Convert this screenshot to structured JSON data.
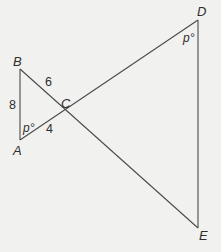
{
  "diagram": {
    "type": "two triangles sharing vertex C (bowtie / vertical angles)",
    "colors": {
      "background": "#f1f1ef",
      "stroke": "#4a4a4a",
      "text": "#2e2e2e"
    },
    "points": {
      "A": {
        "label": "A",
        "x": 20,
        "y": 140
      },
      "B": {
        "label": "B",
        "x": 20,
        "y": 69
      },
      "C": {
        "label": "C",
        "x": 65,
        "y": 111
      },
      "D": {
        "label": "D",
        "x": 198,
        "y": 20
      },
      "E": {
        "label": "E",
        "x": 198,
        "y": 228
      }
    },
    "segments": [
      {
        "from": "A",
        "to": "B"
      },
      {
        "from": "B",
        "to": "E"
      },
      {
        "from": "A",
        "to": "D"
      },
      {
        "from": "D",
        "to": "E"
      }
    ],
    "side_labels": {
      "AB": "8",
      "BC": "6",
      "AC": "4"
    },
    "angle_labels": {
      "A": "p°",
      "D": "p°"
    }
  }
}
